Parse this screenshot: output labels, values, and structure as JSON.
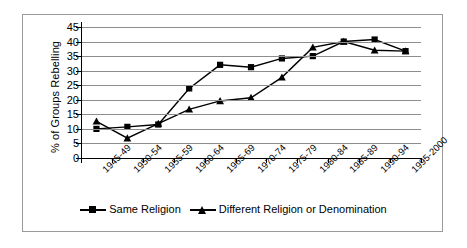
{
  "chart_data": {
    "type": "line",
    "title": "",
    "subtitle": "",
    "xlabel": "",
    "ylabel": "% of Groups Rebelling",
    "ylim": [
      0,
      45
    ],
    "ytick_step": 5,
    "yticks": [
      45,
      40,
      35,
      30,
      25,
      20,
      15,
      10,
      5,
      0
    ],
    "grid": true,
    "legend_position": "bottom",
    "categories": [
      "1945-49",
      "1950-54",
      "1955-59",
      "1960-64",
      "1965-69",
      "1970-74",
      "1975-79",
      "1980-84",
      "1985-89",
      "1990-94",
      "1995-2000"
    ],
    "series": [
      {
        "name": "Same Religion",
        "marker": "square",
        "values": [
          10.0,
          10.7,
          11.5,
          23.9,
          32.0,
          31.2,
          34.2,
          35.0,
          40.0,
          40.7,
          36.7
        ]
      },
      {
        "name": "Different Religion or Denomination",
        "marker": "triangle",
        "values": [
          12.6,
          6.8,
          11.8,
          16.7,
          19.6,
          20.7,
          27.7,
          38.0,
          40.0,
          37.0,
          36.7
        ]
      }
    ],
    "colors": {
      "series_line": "#000000",
      "gridline": "#8d8d8d",
      "axis": "#000000",
      "border": "#9a9a9a",
      "background": "#ffffff"
    }
  },
  "legend": {
    "entries": [
      {
        "label": "Same Religion"
      },
      {
        "label": "Different Religion or Denomination"
      }
    ]
  }
}
